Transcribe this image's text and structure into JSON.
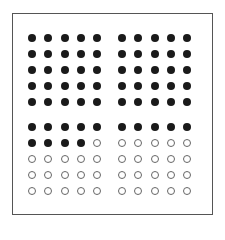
{
  "diagram": {
    "type": "icon-array",
    "total": 100,
    "filled_count": 64,
    "empty_count": 36,
    "colors": {
      "filled": "#1a1a1a",
      "empty_outline": "#666666",
      "frame": "#555555",
      "background": "#ffffff"
    },
    "blocks": [
      {
        "id": "top-left",
        "rows": 5,
        "cols": 5,
        "filled": 25
      },
      {
        "id": "top-right",
        "rows": 5,
        "cols": 5,
        "filled": 25
      },
      {
        "id": "bottom-left",
        "rows": 5,
        "cols": 5,
        "filled": 9
      },
      {
        "id": "bottom-right",
        "rows": 5,
        "cols": 5,
        "filled": 5
      }
    ]
  }
}
